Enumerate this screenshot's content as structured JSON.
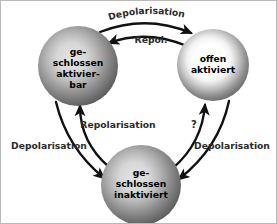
{
  "diagram": {
    "type": "state-cycle",
    "background_color": "#ffffff",
    "arrow_color": "#111111",
    "label_color": "#2b2b2b",
    "nodes": [
      {
        "id": "geschlossen-aktivierbar",
        "lines": [
          "ge-",
          "schlossen",
          "aktivier-",
          "bar"
        ],
        "position": "left",
        "fill_style": "gray-sphere",
        "center_color": "#d9d9d9",
        "edge_color": "#636363"
      },
      {
        "id": "offen-aktiviert",
        "lines": [
          "offen",
          "aktiviert"
        ],
        "position": "top-right",
        "fill_style": "white-center-sphere",
        "center_color": "#ffffff",
        "edge_color": "#6b6b6b"
      },
      {
        "id": "geschlossen-inaktiviert",
        "lines": [
          "ge-",
          "schlossen",
          "inaktiviert"
        ],
        "position": "bottom",
        "fill_style": "gray-sphere",
        "center_color": "#d9d9d9",
        "edge_color": "#636363"
      }
    ],
    "edges": [
      {
        "id": "edge-depolarisation-top",
        "label": "Depolarisation",
        "from": "geschlossen-aktivierbar",
        "to": "offen-aktiviert",
        "label_style": "curved-arc",
        "label_position": "top"
      },
      {
        "id": "edge-repol",
        "label": "Repol.",
        "from": "offen-aktiviert",
        "to": "geschlossen-aktivierbar",
        "label_style": "horizontal",
        "label_position": "top-inner"
      },
      {
        "id": "edge-depolarisation-left",
        "label": "Depolarisation",
        "from": "geschlossen-aktivierbar",
        "to": "geschlossen-inaktiviert",
        "label_style": "horizontal",
        "label_position": "left"
      },
      {
        "id": "edge-repolarisation",
        "label": "Repolarisation",
        "from": "geschlossen-inaktiviert",
        "to": "geschlossen-aktivierbar",
        "label_style": "horizontal",
        "label_position": "center"
      },
      {
        "id": "edge-unknown",
        "label": "?",
        "from": "geschlossen-inaktiviert",
        "to": "offen-aktiviert",
        "label_style": "horizontal",
        "label_position": "center-right"
      },
      {
        "id": "edge-depolarisation-right",
        "label": "Depolarisation",
        "from": "offen-aktiviert",
        "to": "geschlossen-inaktiviert",
        "label_style": "horizontal",
        "label_position": "right"
      }
    ]
  }
}
